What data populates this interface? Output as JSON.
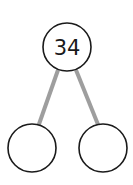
{
  "diagram": {
    "type": "number-bond",
    "whole": {
      "value": "34"
    },
    "parts": [
      {
        "value": ""
      },
      {
        "value": ""
      }
    ],
    "colors": {
      "circle_stroke": "#1a1a1a",
      "connector": "#9e9e9e",
      "background": "#ffffff"
    }
  }
}
